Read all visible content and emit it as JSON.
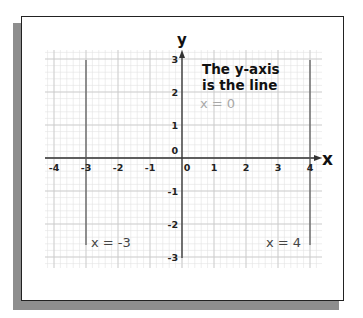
{
  "diagram": {
    "title_text_line1": "The y-axis",
    "title_text_line2": "is the line",
    "y_axis_equation": "x = 0",
    "axis_labels": {
      "x": "x",
      "y": "y"
    },
    "x_ticks": [
      "-4",
      "-3",
      "-2",
      "-1",
      "0",
      "1",
      "2",
      "3",
      "4"
    ],
    "y_ticks": [
      "3",
      "2",
      "1",
      "0",
      "-1",
      "-2",
      "-3"
    ],
    "origin_label_y": "0",
    "lines": [
      {
        "name": "line-x-neg3",
        "label": "x = -3",
        "x": -3
      },
      {
        "name": "line-x-4",
        "label": "x = 4",
        "x": 4
      }
    ],
    "colors": {
      "grid_minor": "#e3e3e3",
      "grid_major": "#c9c9c9",
      "axis": "#333333",
      "line": "#555555",
      "label_dark": "#111111",
      "label_gray": "#a8a8a8",
      "label_mid": "#444444",
      "shadow": "#8e8e8e"
    }
  }
}
